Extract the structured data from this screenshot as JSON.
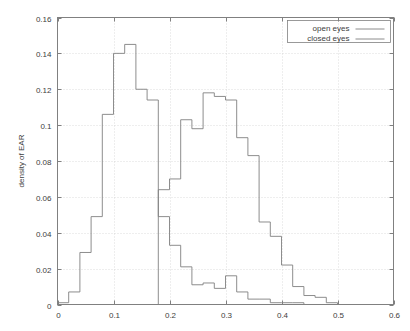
{
  "chart_data": {
    "type": "line",
    "render_style": "step-histogram",
    "title": "",
    "subtitle": "",
    "xlabel": "",
    "ylabel": "density of EAR",
    "xlim": [
      0,
      0.6
    ],
    "ylim": [
      0,
      0.16
    ],
    "xticks": [
      0,
      0.1,
      0.2,
      0.3,
      0.4,
      0.5,
      0.6
    ],
    "xticklabels": [
      "0",
      "0.1",
      "0.2",
      "0.3",
      "0.4",
      "0.5",
      "0.6"
    ],
    "yticks": [
      0,
      0.02,
      0.04,
      0.06,
      0.08,
      0.1,
      0.12,
      0.14,
      0.16
    ],
    "yticklabels": [
      "0",
      "0.02",
      "0.04",
      "0.06",
      "0.08",
      "0.1",
      "0.12",
      "0.14",
      "0.16"
    ],
    "grid": true,
    "grid_style": "dotted",
    "legend_position": "top-right",
    "bin_width": 0.02,
    "series": [
      {
        "name": "open eyes",
        "color": "#808080",
        "bin_starts": [
          0.18,
          0.2,
          0.22,
          0.24,
          0.26,
          0.28,
          0.3,
          0.32,
          0.34,
          0.36,
          0.38,
          0.4,
          0.42,
          0.44,
          0.46,
          0.48,
          0.5,
          0.52
        ],
        "values": [
          0.064,
          0.07,
          0.103,
          0.098,
          0.118,
          0.116,
          0.114,
          0.093,
          0.083,
          0.046,
          0.038,
          0.022,
          0.01,
          0.005,
          0.004,
          0.001,
          0.0,
          0.0
        ]
      },
      {
        "name": "closed eyes",
        "color": "#808080",
        "bin_starts": [
          0.0,
          0.02,
          0.04,
          0.06,
          0.08,
          0.1,
          0.12,
          0.14,
          0.16,
          0.18,
          0.2,
          0.22,
          0.24,
          0.26,
          0.28,
          0.3,
          0.32,
          0.34,
          0.36,
          0.38,
          0.4,
          0.42,
          0.44,
          0.46,
          0.48,
          0.5
        ],
        "values": [
          0.001,
          0.007,
          0.029,
          0.049,
          0.106,
          0.14,
          0.145,
          0.12,
          0.114,
          0.049,
          0.033,
          0.021,
          0.011,
          0.012,
          0.009,
          0.016,
          0.007,
          0.003,
          0.003,
          0.001,
          0.001,
          0.001,
          0.0,
          0.0,
          0.0,
          0.0
        ]
      }
    ],
    "legend": [
      {
        "label": "open eyes"
      },
      {
        "label": "closed eyes"
      }
    ]
  },
  "colors": {
    "background": "#ffffff",
    "frame": "#808080",
    "grid": "#c8c8c8",
    "text": "#404040"
  }
}
